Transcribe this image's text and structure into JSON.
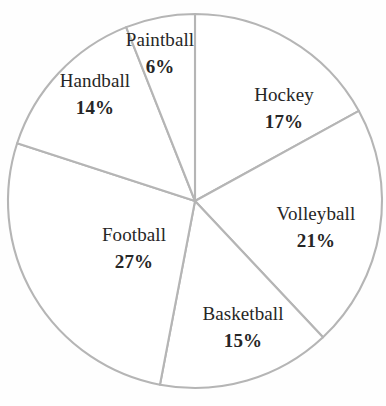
{
  "chart_data": {
    "type": "pie",
    "title": "",
    "subtitle": "",
    "xlabel": "",
    "ylabel": "",
    "legend": "none",
    "grid": false,
    "units": "%",
    "total": 100,
    "start_angle_deg": 90,
    "direction": "clockwise",
    "categories": [
      "Hockey",
      "Volleyball",
      "Basketball",
      "Football",
      "Handball",
      "Paintball"
    ],
    "values": [
      17,
      21,
      15,
      27,
      14,
      6
    ],
    "slices": [
      {
        "key": "hockey",
        "label": "Hockey",
        "value": 17,
        "value_text": "17%",
        "start_deg": 90,
        "end_deg": 28.8,
        "label_x": 284,
        "label_y": 82
      },
      {
        "key": "volleyball",
        "label": "Volleyball",
        "value": 21,
        "value_text": "21%",
        "start_deg": 28.8,
        "end_deg": -46.8,
        "label_x": 316,
        "label_y": 201
      },
      {
        "key": "basketball",
        "label": "Basketball",
        "value": 15,
        "value_text": "15%",
        "start_deg": -46.8,
        "end_deg": -100.8,
        "label_x": 243,
        "label_y": 301
      },
      {
        "key": "football",
        "label": "Football",
        "value": 27,
        "value_text": "27%",
        "start_deg": -100.8,
        "end_deg": -198,
        "label_x": 134,
        "label_y": 222
      },
      {
        "key": "handball",
        "label": "Handball",
        "value": 14,
        "value_text": "14%",
        "start_deg": 162,
        "end_deg": 111.6,
        "label_x": 95,
        "label_y": 68
      },
      {
        "key": "paintball",
        "label": "Paintball",
        "value": 6,
        "value_text": "6%",
        "start_deg": 111.6,
        "end_deg": 90,
        "label_x": 160,
        "label_y": 27
      }
    ],
    "colors": {
      "slice_fill": "#ffffff",
      "slice_stroke": "#b5b5b5",
      "label_text": "#262626",
      "background": "#fefefe"
    },
    "geometry": {
      "center_x": 195,
      "center_y": 201,
      "radius": 187
    }
  }
}
